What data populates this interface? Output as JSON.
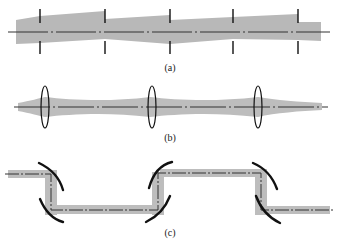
{
  "figure": {
    "panels": [
      {
        "id": "a",
        "label": "(a)",
        "description": "Beam waveguide with thin apertures (iris irises) periodically spaced along optical axis"
      },
      {
        "id": "b",
        "label": "(b)",
        "description": "Lens waveguide with periodic biconvex lenses refocusing the beam"
      },
      {
        "id": "c",
        "label": "(c)",
        "description": "Folded beam path using curved mirror pairs"
      }
    ],
    "colors": {
      "beam": "#b8b8b8",
      "axis": "#333333",
      "element": "#111111"
    }
  }
}
